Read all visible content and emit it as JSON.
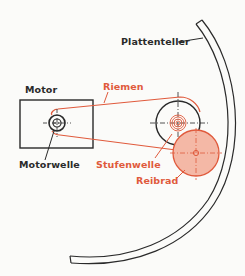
{
  "diagram": {
    "type": "schematic",
    "colors": {
      "ink": "#2a2a2a",
      "accent": "#e05a3c",
      "reibrad_fill": "#f4b8a6",
      "background": "#fbfbf9"
    },
    "labels": {
      "plattenteller": "Plattenteller",
      "motor": "Motor",
      "riemen": "Riemen",
      "motorwelle": "Motorwelle",
      "stufenwelle": "Stufenwelle",
      "reibrad": "Reibrad"
    },
    "components": [
      {
        "id": "motor",
        "label": "Motor",
        "shape": "rectangle",
        "color": "ink"
      },
      {
        "id": "motorwelle",
        "label": "Motorwelle",
        "shape": "concentric-circles",
        "color": "ink"
      },
      {
        "id": "riemen",
        "label": "Riemen",
        "shape": "belt",
        "color": "accent"
      },
      {
        "id": "stufenwelle",
        "label": "Stufenwelle",
        "shape": "stepped-pulley",
        "color": "accent"
      },
      {
        "id": "reibrad",
        "label": "Reibrad",
        "shape": "filled-circle",
        "color": "accent"
      },
      {
        "id": "plattenteller",
        "label": "Plattenteller",
        "shape": "arc",
        "color": "ink"
      }
    ],
    "connections": [
      {
        "from": "motorwelle",
        "to": "stufenwelle",
        "via": "riemen"
      },
      {
        "from": "stufenwelle",
        "to": "reibrad",
        "via": "contact"
      },
      {
        "from": "reibrad",
        "to": "plattenteller",
        "via": "contact"
      }
    ]
  }
}
